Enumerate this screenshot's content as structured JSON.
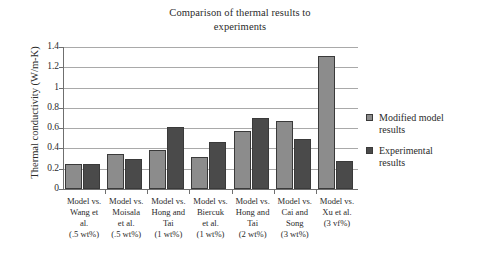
{
  "chart_data": {
    "type": "bar",
    "title": "Comparison of thermal results to experiments",
    "title_line1": "Comparison of thermal results to",
    "title_line2": "experiments",
    "xlabel": "",
    "ylabel": "Thermal conductivity (W/m-K)",
    "ylim": [
      0,
      1.4
    ],
    "ytick_labels": [
      "1.4",
      "1.2",
      "1",
      "0.8",
      "0.6",
      "0.4",
      "0.2",
      "0"
    ],
    "ytick_values": [
      1.4,
      1.2,
      1.0,
      0.8,
      0.6,
      0.4,
      0.2,
      0
    ],
    "grid": true,
    "legend_position": "right",
    "categories": [
      {
        "line1": "Model vs.",
        "line2": "Wang et",
        "line3": "al.",
        "line4": "(.5 wt%)"
      },
      {
        "line1": "Model vs.",
        "line2": "Moisala",
        "line3": "et al.",
        "line4": "(.5 wt%)"
      },
      {
        "line1": "Model vs.",
        "line2": "Hong and",
        "line3": "Tai",
        "line4": "(1 wt%)"
      },
      {
        "line1": "Model vs.",
        "line2": "Biercuk",
        "line3": "et al.",
        "line4": "(1 wt%)"
      },
      {
        "line1": "Model vs.",
        "line2": "Hong and",
        "line3": "Tai",
        "line4": "(2 wt%)"
      },
      {
        "line1": "Model vs.",
        "line2": "Cai and",
        "line3": "Song",
        "line4": "(3 wt%)"
      },
      {
        "line1": "Model vs.",
        "line2": "Xu et al.",
        "line3": "(3 vf%)",
        "line4": ""
      }
    ],
    "series": [
      {
        "name": "Modified model results",
        "legend_line1": "Modified model",
        "legend_line2": "results",
        "color": "#8c8c8c",
        "values": [
          0.25,
          0.35,
          0.38,
          0.32,
          0.57,
          0.67,
          1.31
        ]
      },
      {
        "name": "Experimental results",
        "legend_line1": "Experimental",
        "legend_line2": "results",
        "color": "#4a4a4a",
        "values": [
          0.25,
          0.3,
          0.61,
          0.46,
          0.7,
          0.49,
          0.28
        ]
      }
    ]
  }
}
